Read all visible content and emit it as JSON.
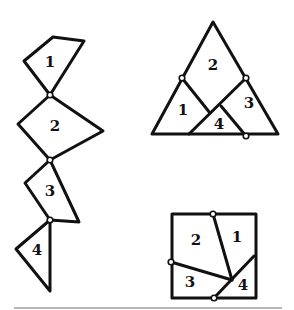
{
  "diagram": {
    "title": "",
    "stroke_color": "#111111",
    "rule_color": "#b8b8b8",
    "chain": {
      "pieces": [
        {
          "label": "1",
          "points": "53,37 84,41 50,95 24,61",
          "label_pos": [
            50,
            62
          ]
        },
        {
          "label": "2",
          "points": "50,95 103,131 50,160 18,124",
          "label_pos": [
            55,
            126
          ]
        },
        {
          "label": "3",
          "points": "50,160 79,222 50,220 25,183",
          "label_pos": [
            50,
            191
          ]
        },
        {
          "label": "4",
          "points": "50,220 50,291 16,249",
          "label_pos": [
            37,
            250
          ]
        }
      ],
      "hinges": [
        [
          50,
          95
        ],
        [
          50,
          160
        ],
        [
          50,
          220
        ]
      ]
    },
    "triangle": {
      "outline": "213,22 278,134 152,134",
      "cuts": [
        {
          "from": [
            182,
            78
          ],
          "to": [
            210,
            113
          ]
        },
        {
          "from": [
            246,
            78
          ],
          "to": [
            189,
            134
          ]
        },
        {
          "from": [
            221,
            106
          ],
          "to": [
            246,
            136
          ]
        }
      ],
      "labels": [
        {
          "label": "2",
          "pos": [
            213,
            65
          ]
        },
        {
          "label": "1",
          "pos": [
            183,
            110
          ]
        },
        {
          "label": "4",
          "pos": [
            219,
            124
          ]
        },
        {
          "label": "3",
          "pos": [
            249,
            103
          ]
        }
      ],
      "hinges": [
        [
          182,
          78
        ],
        [
          246,
          78
        ],
        [
          246,
          136
        ]
      ]
    },
    "square": {
      "outline": "172,214 256,214 256,298 172,298",
      "cuts": [
        {
          "from": [
            213,
            214
          ],
          "to": [
            232,
            280
          ]
        },
        {
          "from": [
            171,
            262
          ],
          "to": [
            232,
            280
          ]
        },
        {
          "from": [
            214,
            298
          ],
          "to": [
            254,
            256
          ]
        }
      ],
      "labels": [
        {
          "label": "1",
          "pos": [
            237,
            237
          ]
        },
        {
          "label": "2",
          "pos": [
            196,
            240
          ]
        },
        {
          "label": "3",
          "pos": [
            190,
            282
          ]
        },
        {
          "label": "4",
          "pos": [
            243,
            285
          ]
        }
      ],
      "hinges": [
        [
          213,
          214
        ],
        [
          171,
          262
        ],
        [
          214,
          298
        ]
      ]
    },
    "rule": {
      "x1": 14,
      "x2": 282,
      "y": 308
    }
  }
}
